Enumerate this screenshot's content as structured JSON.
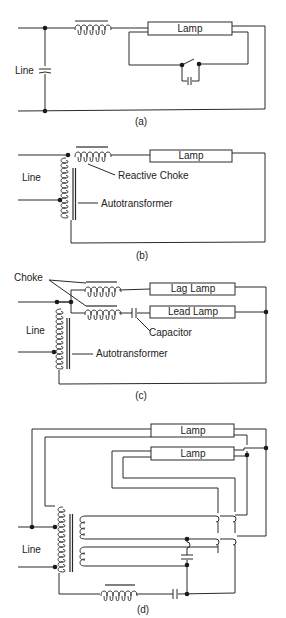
{
  "figure": {
    "panels": [
      {
        "id": "a",
        "caption": "(a)",
        "labels": {
          "line": "Line",
          "lamp": "Lamp"
        }
      },
      {
        "id": "b",
        "caption": "(b)",
        "labels": {
          "line": "Line",
          "lamp": "Lamp",
          "reactive_choke": "Reactive Choke",
          "autotransformer": "Autotransformer"
        }
      },
      {
        "id": "c",
        "caption": "(c)",
        "labels": {
          "line": "Line",
          "choke": "Choke",
          "lag_lamp": "Lag Lamp",
          "lead_lamp": "Lead Lamp",
          "capacitor": "Capacitor",
          "autotransformer": "Autotransformer"
        }
      },
      {
        "id": "d",
        "caption": "(d)",
        "labels": {
          "line": "Line",
          "lamp_top": "Lamp",
          "lamp_bottom": "Lamp"
        }
      }
    ],
    "colors": {
      "ink": "#2a2a2a",
      "background": "#ffffff"
    }
  }
}
